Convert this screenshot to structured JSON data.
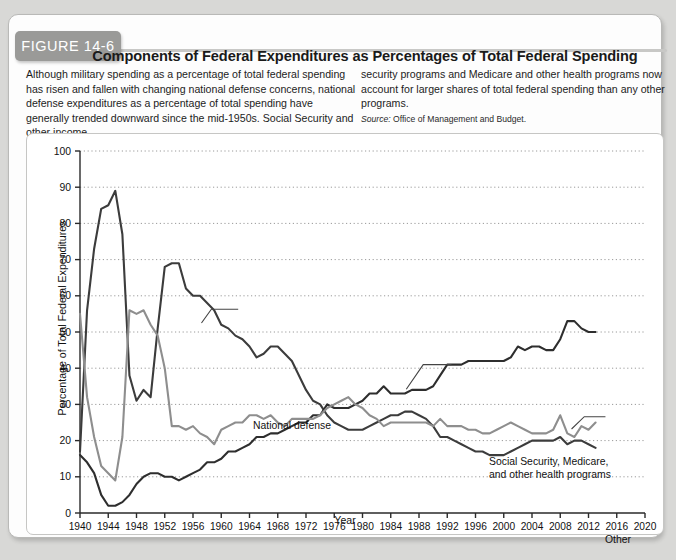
{
  "figure": {
    "badge": "FIGURE 14-6",
    "title": "Components of Federal Expenditures as Percentages of Total Federal Spending",
    "blurb_left": "Although military spending as a percentage of total federal spending has risen and fallen with changing national defense concerns, national defense expenditures as a percentage of total spending have generally trended downward since the mid-1950s. Social Security and other income",
    "blurb_right": "security programs and Medicare and other health programs now account for larger shares of total federal spending than any other programs.",
    "source_label": "Source:",
    "source_text": "Office of Management and Budget."
  },
  "chart_data": {
    "type": "line",
    "title": "Components of Federal Expenditures as Percentages of Total Federal Spending",
    "xlabel": "Year",
    "ylabel": "Percentage of Total Federal Expenditures",
    "xlim": [
      1940,
      2020
    ],
    "ylim": [
      0,
      100
    ],
    "xticks": [
      1940,
      1944,
      1948,
      1952,
      1956,
      1960,
      1964,
      1968,
      1972,
      1976,
      1980,
      1984,
      1988,
      1992,
      1996,
      2000,
      2004,
      2008,
      2012,
      2016,
      2020
    ],
    "yticks": [
      0,
      10,
      20,
      30,
      40,
      50,
      60,
      70,
      80,
      90,
      100
    ],
    "grid": "horizontal-dotted",
    "legend": "inline-annotations",
    "colors": {
      "national_defense": "#3c3c3c",
      "social_security": "#2e2e2e",
      "other": "#8e8e8e",
      "axis": "#2a2a2a",
      "gridline": "#9a9a9a",
      "panel_bg": "#ffffff"
    },
    "annotations": [
      {
        "name": "national-defense",
        "text": "National defense",
        "year": 1960,
        "value": 56
      },
      {
        "name": "social-security",
        "text": "Social Security, Medicare,\nand other health programs",
        "year": 1988,
        "value": 44
      },
      {
        "name": "other",
        "text": "Other",
        "year": 2014,
        "value": 26
      }
    ],
    "x": [
      1940,
      1941,
      1942,
      1943,
      1944,
      1945,
      1946,
      1947,
      1948,
      1949,
      1950,
      1951,
      1952,
      1953,
      1954,
      1955,
      1956,
      1957,
      1958,
      1959,
      1960,
      1961,
      1962,
      1963,
      1964,
      1965,
      1966,
      1967,
      1968,
      1969,
      1970,
      1971,
      1972,
      1973,
      1974,
      1975,
      1976,
      1977,
      1978,
      1979,
      1980,
      1981,
      1982,
      1983,
      1984,
      1985,
      1986,
      1987,
      1988,
      1989,
      1990,
      1991,
      1992,
      1993,
      1994,
      1995,
      1996,
      1997,
      1998,
      1999,
      2000,
      2001,
      2002,
      2003,
      2004,
      2005,
      2006,
      2007,
      2008,
      2009,
      2010,
      2011,
      2012,
      2013
    ],
    "series": [
      {
        "name": "National defense",
        "color": "#3c3c3c",
        "values": [
          17,
          56,
          73,
          84,
          85,
          89,
          77,
          38,
          31,
          34,
          32,
          51,
          68,
          69,
          69,
          62,
          60,
          60,
          58,
          56,
          52,
          51,
          49,
          48,
          46,
          43,
          44,
          46,
          46,
          44,
          42,
          38,
          34,
          31,
          30,
          27,
          25,
          24,
          23,
          23,
          23,
          24,
          25,
          26,
          27,
          27,
          28,
          28,
          27,
          26,
          24,
          21,
          21,
          20,
          19,
          18,
          17,
          17,
          16,
          16,
          16,
          17,
          18,
          19,
          20,
          20,
          20,
          20,
          21,
          19,
          20,
          20,
          19,
          18
        ]
      },
      {
        "name": "Social Security, Medicare, and other health programs",
        "color": "#2e2e2e",
        "values": [
          16,
          14,
          11,
          5,
          2,
          2,
          3,
          5,
          8,
          10,
          11,
          11,
          10,
          10,
          9,
          10,
          11,
          12,
          14,
          14,
          15,
          17,
          17,
          18,
          19,
          21,
          21,
          22,
          22,
          23,
          24,
          25,
          25,
          27,
          27,
          30,
          29,
          29,
          29,
          30,
          31,
          33,
          33,
          35,
          33,
          33,
          33,
          34,
          34,
          34,
          35,
          38,
          41,
          41,
          41,
          42,
          42,
          42,
          42,
          42,
          42,
          43,
          46,
          45,
          46,
          46,
          45,
          45,
          48,
          53,
          53,
          51,
          50,
          50
        ]
      },
      {
        "name": "Other",
        "color": "#8e8e8e",
        "values": [
          55,
          32,
          21,
          13,
          11,
          9,
          21,
          56,
          55,
          56,
          52,
          49,
          40,
          24,
          24,
          23,
          24,
          22,
          21,
          19,
          23,
          24,
          25,
          25,
          27,
          27,
          26,
          27,
          25,
          24,
          26,
          26,
          26,
          26,
          27,
          29,
          30,
          31,
          32,
          30,
          29,
          27,
          26,
          24,
          25,
          25,
          25,
          25,
          25,
          25,
          24,
          26,
          24,
          24,
          24,
          23,
          23,
          22,
          22,
          23,
          24,
          25,
          24,
          23,
          22,
          22,
          22,
          23,
          27,
          22,
          21,
          24,
          23,
          25
        ]
      }
    ]
  }
}
